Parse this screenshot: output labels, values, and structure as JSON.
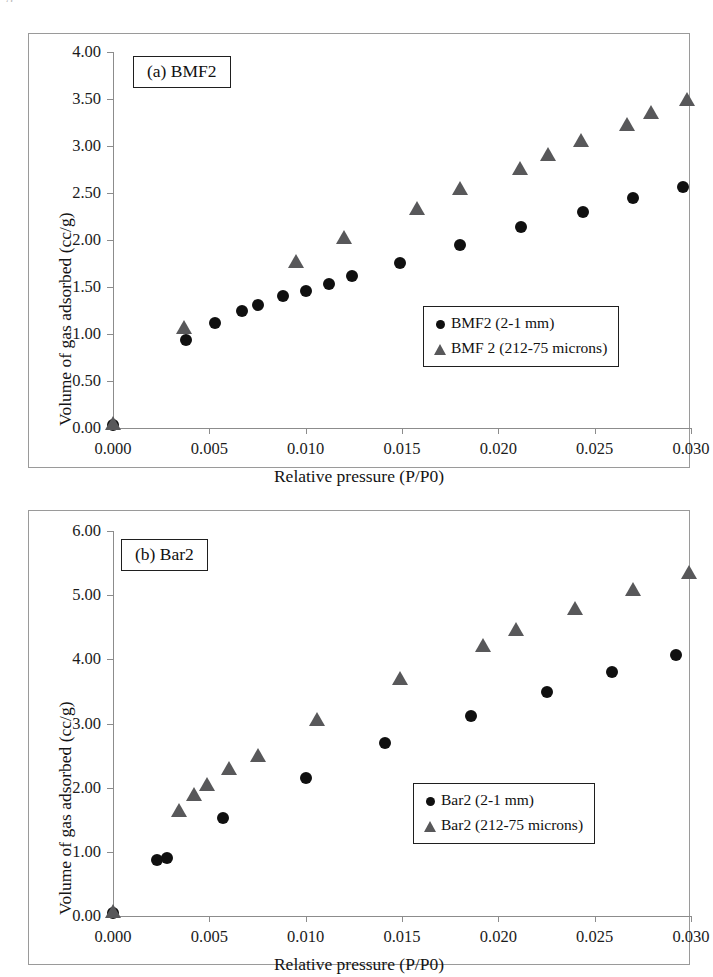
{
  "page": {
    "top_fragment": "g"
  },
  "chart_data": [
    {
      "type": "scatter",
      "panel_label": "(a) BMF2",
      "title": "",
      "xlabel": "Relative pressure (P/P0)",
      "ylabel": "Volume of gas adsorbed (cc/g)",
      "xlim": [
        0.0,
        0.03
      ],
      "ylim": [
        0.0,
        4.0
      ],
      "xticks": [
        "0.000",
        "0.005",
        "0.010",
        "0.015",
        "0.020",
        "0.025",
        "0.030"
      ],
      "xtick_values": [
        0.0,
        0.005,
        0.01,
        0.015,
        0.02,
        0.025,
        0.03
      ],
      "yticks": [
        "0.00",
        "0.50",
        "1.00",
        "1.50",
        "2.00",
        "2.50",
        "3.00",
        "3.50",
        "4.00"
      ],
      "ytick_values": [
        0.0,
        0.5,
        1.0,
        1.5,
        2.0,
        2.5,
        3.0,
        3.5,
        4.0
      ],
      "grid": false,
      "legend_position": "lower-right",
      "series": [
        {
          "name": "BMF2 (2-1 mm)",
          "marker": "circle",
          "color": "#101010",
          "points": [
            [
              0.0,
              0.03
            ],
            [
              0.0038,
              0.94
            ],
            [
              0.0053,
              1.12
            ],
            [
              0.0067,
              1.24
            ],
            [
              0.0075,
              1.31
            ],
            [
              0.0088,
              1.4
            ],
            [
              0.01,
              1.46
            ],
            [
              0.0112,
              1.53
            ],
            [
              0.0124,
              1.62
            ],
            [
              0.0149,
              1.76
            ],
            [
              0.018,
              1.95
            ],
            [
              0.0212,
              2.14
            ],
            [
              0.0244,
              2.3
            ],
            [
              0.027,
              2.45
            ],
            [
              0.0296,
              2.56
            ]
          ]
        },
        {
          "name": "BMF 2 (212-75 microns)",
          "marker": "triangle",
          "color": "#58585a",
          "points": [
            [
              0.0,
              0.04
            ],
            [
              0.0037,
              1.06
            ],
            [
              0.0095,
              1.77
            ],
            [
              0.012,
              2.02
            ],
            [
              0.0158,
              2.33
            ],
            [
              0.018,
              2.54
            ],
            [
              0.0211,
              2.76
            ],
            [
              0.0226,
              2.9
            ],
            [
              0.0243,
              3.05
            ],
            [
              0.0267,
              3.22
            ],
            [
              0.0279,
              3.35
            ],
            [
              0.0298,
              3.49
            ]
          ]
        }
      ]
    },
    {
      "type": "scatter",
      "panel_label": "(b) Bar2",
      "title": "",
      "xlabel": "Relative pressure (P/P0)",
      "ylabel": "Volume of gas adsorbed (cc/g)",
      "xlim": [
        0.0,
        0.03
      ],
      "ylim": [
        0.0,
        6.0
      ],
      "xticks": [
        "0.000",
        "0.005",
        "0.010",
        "0.015",
        "0.020",
        "0.025",
        "0.030"
      ],
      "xtick_values": [
        0.0,
        0.005,
        0.01,
        0.015,
        0.02,
        0.025,
        0.03
      ],
      "yticks": [
        "0.00",
        "1.00",
        "2.00",
        "3.00",
        "4.00",
        "5.00",
        "6.00"
      ],
      "ytick_values": [
        0.0,
        1.0,
        2.0,
        3.0,
        4.0,
        5.0,
        6.0
      ],
      "grid": false,
      "legend_position": "lower-right",
      "series": [
        {
          "name": "Bar2 (2-1 mm)",
          "marker": "circle",
          "color": "#101010",
          "points": [
            [
              0.0,
              0.05
            ],
            [
              0.0023,
              0.87
            ],
            [
              0.0028,
              0.91
            ],
            [
              0.0057,
              1.52
            ],
            [
              0.01,
              2.15
            ],
            [
              0.0141,
              2.69
            ],
            [
              0.0186,
              3.12
            ],
            [
              0.0225,
              3.49
            ],
            [
              0.0259,
              3.81
            ],
            [
              0.0292,
              4.07
            ]
          ]
        },
        {
          "name": "Bar2 (212-75 microns)",
          "marker": "triangle",
          "color": "#58585a",
          "points": [
            [
              0.0,
              0.07
            ],
            [
              0.0034,
              1.64
            ],
            [
              0.0042,
              1.88
            ],
            [
              0.0049,
              2.04
            ],
            [
              0.006,
              2.29
            ],
            [
              0.0075,
              2.5
            ],
            [
              0.0106,
              3.06
            ],
            [
              0.0149,
              3.7
            ],
            [
              0.0192,
              4.21
            ],
            [
              0.0209,
              4.45
            ],
            [
              0.024,
              4.78
            ],
            [
              0.027,
              5.08
            ],
            [
              0.0299,
              5.35
            ]
          ]
        }
      ]
    }
  ]
}
